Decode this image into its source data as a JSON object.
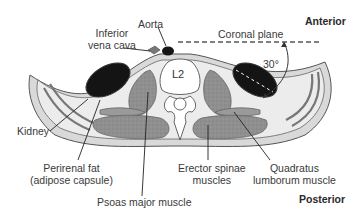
{
  "figure": {
    "orientation": {
      "anterior": "Anterior",
      "posterior": "Posterior"
    },
    "vertebra_label": "L2",
    "plane_label": "Coronal plane",
    "angle_label": "30°",
    "labels": {
      "aorta": "Aorta",
      "ivc_line1": "Inferior",
      "ivc_line2": "vena cava",
      "kidney": "Kidney",
      "perirenal_line1": "Perirenal fat",
      "perirenal_line2": "(adipose capsule)",
      "psoas": "Psoas major muscle",
      "erector_line1": "Erector spinae",
      "erector_line2": "muscles",
      "quadratus_line1": "Quadratus",
      "quadratus_line2": "lumborum muscle"
    },
    "colors": {
      "organ_dark": "#141414",
      "muscle": "#8f8f8f",
      "fat": "#e4e4e4",
      "tissue_line": "#6a6a6a",
      "bone": "#ffffff",
      "text": "#3a3a3a"
    }
  }
}
